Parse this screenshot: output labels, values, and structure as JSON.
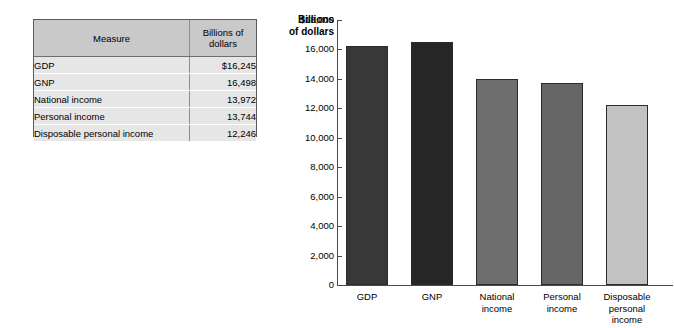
{
  "table": {
    "headers": [
      "Measure",
      "Billions\nof dollars"
    ],
    "rows": [
      {
        "measure": "GDP",
        "value": "$16,245"
      },
      {
        "measure": "GNP",
        "value": "16,498"
      },
      {
        "measure": "National income",
        "value": "13,972"
      },
      {
        "measure": "Personal income",
        "value": "13,744"
      },
      {
        "measure": "Disposable personal income",
        "value": "12,246"
      }
    ]
  },
  "chart_data": {
    "type": "bar",
    "title": "",
    "axis_title": "Billions\nof dollars",
    "xlabel": "",
    "ylabel": "Billions of dollars",
    "categories": [
      "GDP",
      "GNP",
      "National\nincome",
      "Personal\nincome",
      "Disposable\npersonal\nincome"
    ],
    "values": [
      16245,
      16498,
      13972,
      13744,
      12246
    ],
    "bar_colors": [
      "#383838",
      "#262626",
      "#6e6e6e",
      "#666666",
      "#c2c2c2"
    ],
    "ylim": [
      0,
      18000
    ],
    "ytick_labels": [
      "$18,000",
      "16,000",
      "14,000",
      "12,000",
      "10,000",
      "8,000",
      "6,000",
      "4,000",
      "2,000",
      "0"
    ],
    "ytick_values": [
      18000,
      16000,
      14000,
      12000,
      10000,
      8000,
      6000,
      4000,
      2000,
      0
    ],
    "grid": false,
    "legend": "none"
  }
}
